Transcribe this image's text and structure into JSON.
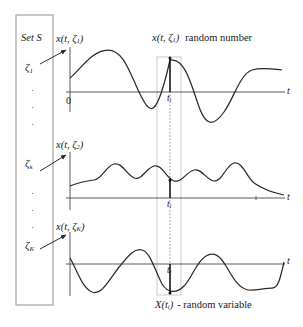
{
  "figure": {
    "type": "stochastic-process-ensemble-diagram",
    "set_box_title": "Set S",
    "time_axis_label": "t",
    "origin_label": "0",
    "time_instant_label": "t",
    "time_instant_sub": "i",
    "top_annotation": {
      "func": "x(t, ζ",
      "func_sub": "1",
      "func_close": ")",
      "text": "random number"
    },
    "bottom_annotation": {
      "func": "X(t",
      "func_sub": "i",
      "func_close": ")",
      "text": "- random variable"
    }
  },
  "set_elements": [
    {
      "name": "zeta-1",
      "symbol": "ζ",
      "sub": "1"
    },
    {
      "name": "dots-upper",
      "symbol": "·"
    },
    {
      "name": "zeta-k",
      "symbol": "ζ",
      "sub": "k"
    },
    {
      "name": "dots-lower",
      "symbol": "·"
    },
    {
      "name": "zeta-K",
      "symbol": "ζ",
      "sub": "K"
    }
  ],
  "plots": [
    {
      "name": "realization-1",
      "axis_label_func": "x(t, ζ",
      "axis_label_sub": "1",
      "axis_label_close": ")",
      "t_label": "t",
      "t_sub": "i",
      "axis_t_label": "t",
      "origin_label": "0",
      "sample_sign": "positive"
    },
    {
      "name": "realization-2",
      "axis_label_func": "x(t, ζ",
      "axis_label_sub": "2",
      "axis_label_close": ")",
      "t_label": "t",
      "t_sub": "i",
      "axis_t_label": "t",
      "origin_label": "",
      "sample_sign": "positive"
    },
    {
      "name": "realization-K",
      "axis_label_func": "x(t, ζ",
      "axis_label_sub": "K",
      "axis_label_close": ")",
      "t_label": "t",
      "t_sub": "i",
      "axis_t_label": "t",
      "origin_label": "",
      "sample_sign": "negative"
    }
  ],
  "chart_data": {
    "type": "line",
    "title": "",
    "xlabel": "t",
    "ylabel": "",
    "grid": false,
    "legend": "none",
    "sample_time": {
      "label": "t_i",
      "x_pixel": 170
    },
    "series": [
      {
        "name": "x(t, zeta_1)",
        "axis_y": 92,
        "amplitude": 34,
        "path": "M 70,78 C 80,70 92,50 108,50 C 124,50 130,74 140,94 C 150,114 156,122 170,60 C 184,58 190,80 198,104 C 206,128 214,126 224,112 C 234,98 240,74 252,70 C 262,67 272,69 282,70"
      },
      {
        "name": "x(t, zeta_2)",
        "axis_y": 198,
        "amplitude": 26,
        "path": "M 70,186 C 80,182 86,181 94,180 C 102,179 106,166 114,164 C 122,162 126,174 134,178 C 142,181 146,168 154,166 C 162,164 166,178 174,181 C 182,183 186,172 194,170 C 202,168 206,180 214,181 C 222,182 226,165 234,163 C 242,161 246,176 254,183 C 264,190 274,193 284,195"
      },
      {
        "name": "x(t, zeta_K)",
        "axis_y": 264,
        "amplitude": 32,
        "path": "M 70,258 C 76,268 82,288 92,292 C 102,296 110,278 120,266 C 128,256 134,248 142,250 C 150,252 154,268 162,284 C 168,293 176,294 184,286 C 192,278 196,262 206,256 C 214,251 220,256 226,266 C 232,276 238,288 248,290 C 256,291 264,288 272,288 C 278,288 280,280 284,262"
      }
    ]
  }
}
